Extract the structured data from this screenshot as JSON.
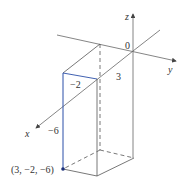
{
  "diagram": {
    "axes": {
      "x_label": "x",
      "y_label": "y",
      "z_label": "z",
      "origin_label": "0"
    },
    "tick_labels": {
      "x_value": "3",
      "y_value": "−2",
      "z_value": "−6"
    },
    "point_label": "(3, −2, −6)",
    "colors": {
      "axis": "#555555",
      "box_edge": "#555555",
      "highlight": "#2b4fa8",
      "point": "#1a2f7a"
    }
  }
}
